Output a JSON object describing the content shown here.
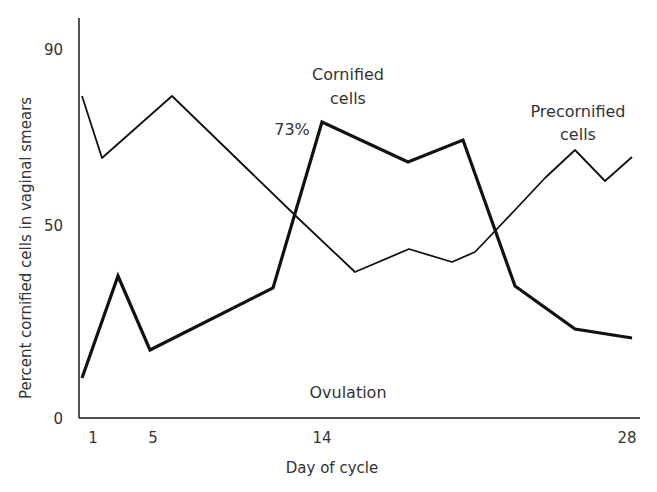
{
  "chart_data": {
    "type": "line",
    "title": "",
    "xlabel": "Day of cycle",
    "ylabel": "Percent cornified cells in vaginal smears",
    "xticks": [
      "1",
      "5",
      "14",
      "28"
    ],
    "yticks": [
      "0",
      "50",
      "90"
    ],
    "ylim": [
      0,
      90
    ],
    "xlim": [
      0.5,
      28.5
    ],
    "grid": false,
    "legend": "inline annotations",
    "annotations": {
      "cornified_title": "Cornified",
      "cornified_title2": "cells",
      "peak_label": "73%",
      "precornified_title": "Precornified",
      "precornified_title2": "cells",
      "ovulation": "Ovulation"
    },
    "series": [
      {
        "name": "Cornified cells",
        "style": "thick",
        "x": [
          0.5,
          2.5,
          4.5,
          11.5,
          14,
          18.5,
          21,
          23,
          25.8,
          28.3
        ],
        "y": [
          9.8,
          34.7,
          16.6,
          31.8,
          72.4,
          62.6,
          68.0,
          32.3,
          21.8,
          19.6
        ]
      },
      {
        "name": "Precornified cells",
        "style": "thin",
        "x": [
          0.5,
          1.6,
          5.5,
          11.8,
          15.5,
          18.5,
          20.5,
          21.5,
          23,
          25.8,
          27.2,
          28.3
        ],
        "y": [
          78.7,
          63.6,
          78.7,
          48.4,
          35.7,
          41.3,
          38.1,
          40.6,
          50.9,
          65.5,
          57.9,
          63.8
        ]
      }
    ]
  },
  "axis": {
    "y_ticks": [
      {
        "label": "90",
        "value": 90
      },
      {
        "label": "50",
        "value": 50
      },
      {
        "label": "0",
        "value": 0
      }
    ],
    "x_ticks": [
      {
        "label": "1",
        "px": 93
      },
      {
        "label": "5",
        "px": 153
      },
      {
        "label": "14",
        "px": 322
      },
      {
        "label": "28",
        "px": 627
      }
    ],
    "xlabel": "Day of cycle",
    "ylabel": "Percent cornified cells in vaginal smears"
  },
  "lines_px": {
    "cornified": [
      [
        82,
        378
      ],
      [
        118,
        276
      ],
      [
        150,
        350
      ],
      [
        273,
        288
      ],
      [
        322,
        122
      ],
      [
        408,
        162
      ],
      [
        463,
        140
      ],
      [
        515,
        286
      ],
      [
        575,
        329
      ],
      [
        632,
        338
      ]
    ],
    "precornified": [
      [
        82,
        96
      ],
      [
        102,
        158
      ],
      [
        172,
        96
      ],
      [
        300,
        220
      ],
      [
        355,
        272
      ],
      [
        409,
        249
      ],
      [
        452,
        262
      ],
      [
        475,
        252
      ],
      [
        515,
        210
      ],
      [
        545,
        178
      ],
      [
        575,
        150
      ],
      [
        605,
        181
      ],
      [
        632,
        157
      ]
    ]
  }
}
